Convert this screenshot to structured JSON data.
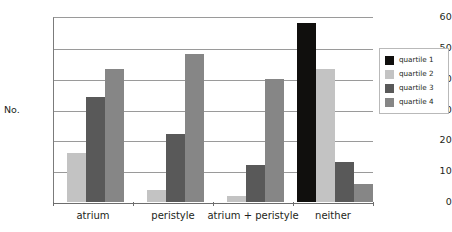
{
  "chart_data": {
    "type": "bar",
    "title": "",
    "xlabel": "",
    "ylabel": "No.",
    "ylim": [
      0,
      60
    ],
    "yticks": [
      0,
      10,
      20,
      30,
      40,
      50,
      60
    ],
    "grid": true,
    "legend_position": "right",
    "categories": [
      "atrium",
      "peristyle",
      "atrium + peristyle",
      "neither"
    ],
    "series": [
      {
        "name": "quartile 1",
        "color": "#100f0d",
        "values": [
          0,
          0,
          0,
          58
        ]
      },
      {
        "name": "quartile 2",
        "color": "#c3c3c3",
        "values": [
          16,
          4,
          2,
          43
        ]
      },
      {
        "name": "quartile 3",
        "color": "#595959",
        "values": [
          34,
          22,
          12,
          13
        ]
      },
      {
        "name": "quartile 4",
        "color": "#868686",
        "values": [
          43,
          48,
          40,
          6
        ]
      }
    ]
  },
  "axis": {
    "y_title": "No.",
    "tick_labels": [
      "0",
      "10",
      "20",
      "30",
      "40",
      "50",
      "60"
    ],
    "category_labels": [
      "atrium",
      "peristyle",
      "atrium + peristyle",
      "neither"
    ]
  },
  "legend": {
    "items": [
      {
        "label": "quartile 1",
        "color": "#100f0d"
      },
      {
        "label": "quartile 2",
        "color": "#c3c3c3"
      },
      {
        "label": "quartile 3",
        "color": "#595959"
      },
      {
        "label": "quartile 4",
        "color": "#868686"
      }
    ]
  },
  "colors": {
    "background": "#ffffff",
    "gridline": "#9a9a9a",
    "axis": "#6d6d6d",
    "text": "#231f20",
    "legend_border": "#b9b9b9"
  }
}
